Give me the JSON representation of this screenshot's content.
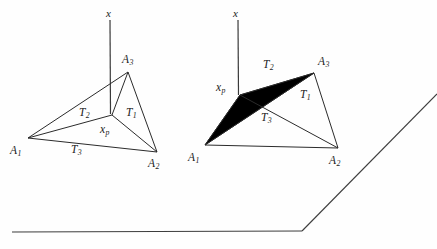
{
  "figure": {
    "background_color": "#fefefe",
    "stroke_color": "#2b2b2b",
    "fill_color": "#000000",
    "width": 437,
    "height": 249
  },
  "left_diagram": {
    "name": "unshaded-triangle",
    "axis_label": "x",
    "vertices": [
      {
        "key": "A1",
        "label": "A",
        "sub": "1",
        "x": 28,
        "y": 138,
        "label_x": 10,
        "label_y": 145
      },
      {
        "key": "A2",
        "label": "A",
        "sub": "2",
        "x": 157,
        "y": 152,
        "label_x": 148,
        "label_y": 158
      },
      {
        "key": "A3",
        "label": "A",
        "sub": "3",
        "x": 128,
        "y": 72,
        "label_x": 122,
        "label_y": 54
      }
    ],
    "interior_point": {
      "key": "xp",
      "label": "x",
      "sub": "p",
      "x": 112,
      "y": 115,
      "label_x": 100,
      "label_y": 124
    },
    "sub_triangles": [
      {
        "key": "T1",
        "label": "T",
        "sub": "1",
        "label_x": 126,
        "label_y": 107
      },
      {
        "key": "T2",
        "label": "T",
        "sub": "2",
        "label_x": 79,
        "label_y": 107
      },
      {
        "key": "T3",
        "label": "T",
        "sub": "3",
        "label_x": 71,
        "label_y": 144
      }
    ],
    "axis": {
      "x": 110,
      "y_top": 20,
      "y_bottom": 114,
      "label_x": 106,
      "label_y": 8
    }
  },
  "right_diagram": {
    "name": "shaded-triangle",
    "axis_label": "x",
    "vertices": [
      {
        "key": "A1",
        "label": "A",
        "sub": "1",
        "x": 205,
        "y": 145,
        "label_x": 188,
        "label_y": 152
      },
      {
        "key": "A2",
        "label": "A",
        "sub": "2",
        "x": 338,
        "y": 148,
        "label_x": 329,
        "label_y": 155
      },
      {
        "key": "A3",
        "label": "A",
        "sub": "3",
        "x": 314,
        "y": 73,
        "label_x": 318,
        "label_y": 56
      }
    ],
    "interior_point": {
      "key": "xp",
      "label": "x",
      "sub": "p",
      "x": 240,
      "y": 95,
      "label_x": 216,
      "label_y": 82
    },
    "sub_triangles": [
      {
        "key": "T1",
        "label": "T",
        "sub": "1",
        "label_x": 300,
        "label_y": 89,
        "shaded": false
      },
      {
        "key": "T2",
        "label": "T",
        "sub": "2",
        "label_x": 263,
        "label_y": 59,
        "shaded": true
      },
      {
        "key": "T3",
        "label": "T",
        "sub": "3",
        "label_x": 261,
        "label_y": 112,
        "shaded": false
      }
    ],
    "axis": {
      "x": 238,
      "y_top": 20,
      "y_bottom": 95,
      "label_x": 233,
      "label_y": 8
    }
  },
  "baseline": {
    "name": "page-baseline-rule",
    "horizontal": {
      "x1": 12,
      "y1": 232,
      "x2": 302,
      "y2": 231
    },
    "diagonal": {
      "x1": 302,
      "y1": 231,
      "x2": 437,
      "y2": 94
    }
  }
}
